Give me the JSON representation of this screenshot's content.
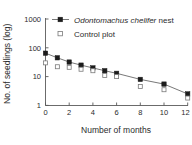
{
  "chart_data": {
    "type": "line",
    "title": "",
    "xlabel": "Number of months",
    "ylabel": "No. of seedlings (log)",
    "x": [
      0,
      1,
      2,
      3,
      4,
      5,
      6,
      8,
      10,
      12
    ],
    "xtick_labels": [
      "0",
      "2",
      "4",
      "6",
      "8",
      "10",
      "12"
    ],
    "xticks": [
      0,
      2,
      4,
      6,
      8,
      10,
      12
    ],
    "xlim": [
      0,
      12
    ],
    "ytick_labels": [
      "1000",
      "100",
      "10",
      "1"
    ],
    "yticks": [
      1000,
      100,
      10,
      1
    ],
    "ylim": [
      1,
      1000
    ],
    "yscale": "log",
    "grid": false,
    "legend_position": "top-right-inside",
    "series": [
      {
        "name": "Odontomachus chelifer nest",
        "name_italic_part": "Odontomachus chelifer",
        "name_plain_part": " nest",
        "marker": "filled-square",
        "line": true,
        "color": "#1c1c1c",
        "values": [
          65,
          45,
          32,
          25,
          20,
          16,
          13,
          8,
          5.5,
          2.5
        ]
      },
      {
        "name": "Control plot",
        "marker": "open-square",
        "line": false,
        "color": "#7a7a7a",
        "values": [
          30,
          22,
          21,
          18,
          16,
          11,
          10,
          4.5,
          3.5,
          1.8
        ]
      }
    ]
  },
  "legend": {
    "items": [
      {
        "label_italic": "Odontomachus chelifer",
        "label_plain": " nest",
        "marker": "filled-square-with-line"
      },
      {
        "label_italic": "",
        "label_plain": "Control plot",
        "marker": "open-square"
      }
    ]
  },
  "axes": {
    "y_title": "No. of seedlings (log)",
    "x_title": "Number of months",
    "y_ticks": [
      "1000",
      "100",
      "10",
      "1"
    ],
    "x_ticks": [
      "0",
      "2",
      "4",
      "6",
      "8",
      "10",
      "12"
    ]
  }
}
